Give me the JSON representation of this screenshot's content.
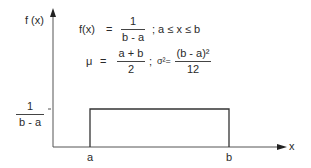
{
  "diagram": {
    "y_axis_label": "f (x)",
    "x_axis_label": "x",
    "x_ticks": [
      "a",
      "b"
    ],
    "y_tick": {
      "numerator": "1",
      "denominator": "b - a"
    },
    "formula_pdf": {
      "lhs": "f(x)",
      "eq": "=",
      "numerator": "1",
      "denominator": "b - a",
      "condition": ";  a ≤ x ≤ b"
    },
    "formula_moments": {
      "mu": "μ",
      "eq": "=",
      "mu_numerator": "a + b",
      "mu_denominator": "2",
      "sep": ";",
      "sigma2": "σ²=",
      "var_numerator": "(b - a)²",
      "var_denominator": "12"
    },
    "colors": {
      "line": "#333333",
      "axis": "#444444",
      "text": "#2a2a2a"
    }
  }
}
